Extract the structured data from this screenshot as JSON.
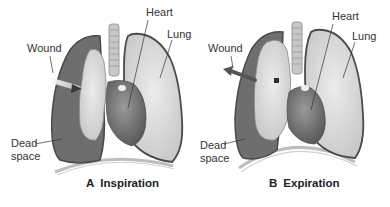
{
  "figure": {
    "panels": [
      {
        "id": "A",
        "letter": "A",
        "title": "Inspiration",
        "labels": {
          "heart": "Heart",
          "lung": "Lung",
          "wound": "Wound",
          "dead_space_line1": "Dead",
          "dead_space_line2": "space"
        },
        "airflow_direction": "inward"
      },
      {
        "id": "B",
        "letter": "B",
        "title": "Expiration",
        "labels": {
          "heart": "Heart",
          "lung": "Lung",
          "wound": "Wound",
          "dead_space_line1": "Dead",
          "dead_space_line2": "space"
        },
        "airflow_direction": "outward"
      }
    ],
    "colors": {
      "dead_space": "#6e6e6e",
      "lung_tissue": "#d9d9d9",
      "lung_outline": "#4a4a4a",
      "heart": "#7a7a7a",
      "trachea": "#c8c8c8",
      "diaphragm": "#bdbdbd"
    }
  }
}
